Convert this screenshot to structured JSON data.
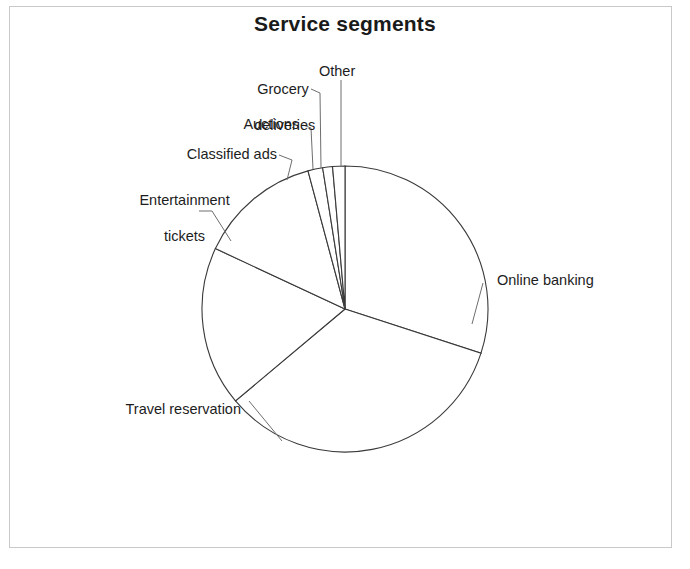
{
  "page": {
    "title": "Service segments",
    "background_color": "#ffffff",
    "frame_color": "#c9c9c9",
    "text_color": "#1d1d1d"
  },
  "chart_data": {
    "type": "pie",
    "title": "Service segments",
    "xlabel": "",
    "ylabel": "",
    "grid": false,
    "legend_position": "none",
    "labels_position": "outside-with-leader-lines",
    "start_angle_deg": 0,
    "direction": "clockwise",
    "categories": [
      "Online banking",
      "Travel reservation",
      "Entertainment tickets",
      "Classified ads",
      "Auctions",
      "Grocery deliveries",
      "Other"
    ],
    "values": [
      30,
      34,
      18,
      14,
      1.7,
      1.1,
      1.4
    ],
    "units": "percent",
    "slices": [
      {
        "label": "Online banking",
        "value": 30,
        "start_deg": 0,
        "end_deg": 108.0
      },
      {
        "label": "Travel reservation",
        "value": 34,
        "start_deg": 108.0,
        "end_deg": 230.0
      },
      {
        "label": "Entertainment tickets",
        "value": 18,
        "start_deg": 230.0,
        "end_deg": 295.0
      },
      {
        "label": "Classified ads",
        "value": 14,
        "start_deg": 295.0,
        "end_deg": 345.0
      },
      {
        "label": "Auctions",
        "value": 1.7,
        "start_deg": 345.0,
        "end_deg": 351.0
      },
      {
        "label": "Grocery deliveries",
        "value": 1.1,
        "start_deg": 351.0,
        "end_deg": 355.0
      },
      {
        "label": "Other",
        "value": 1.4,
        "start_deg": 355.0,
        "end_deg": 360.0
      }
    ],
    "geometry": {
      "cx": 345,
      "cy": 309,
      "r": 143
    },
    "style": {
      "slice_fill": "#ffffff",
      "slice_stroke": "#3a3a3a",
      "leader_stroke": "#6e6e6e"
    }
  },
  "labels": {
    "online_banking": "Online banking",
    "travel_reservation": "Travel reservation",
    "entertainment_tickets_line1": "Entertainment",
    "entertainment_tickets_line2": "tickets",
    "classified_ads": "Classified ads",
    "auctions": "Auctions",
    "grocery_deliveries_line1": "Grocery",
    "grocery_deliveries_line2": "deliveries",
    "other": "Other"
  }
}
